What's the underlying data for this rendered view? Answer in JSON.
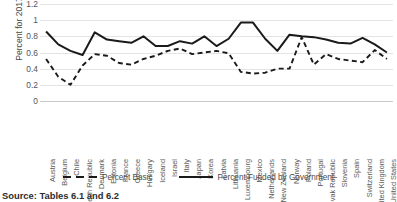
{
  "chart_data": {
    "type": "line",
    "title": "",
    "xlabel": "",
    "ylabel": "Percent for 2017",
    "ylim": [
      0,
      1.2
    ],
    "grid": true,
    "legend_position": "bottom",
    "ytick_labels": [
      "1.2",
      "1",
      "0.8",
      "0.6",
      "0.4",
      "0.2",
      "0"
    ],
    "ytick_values": [
      1.2,
      1,
      0.8,
      0.6,
      0.4,
      0.2,
      0
    ],
    "categories": [
      "Austria",
      "Belgium",
      "Chile",
      "Czech Republic",
      "Denmark",
      "Estonia",
      "France",
      "Greece",
      "Hungary",
      "Iceland",
      "Israel",
      "Italy",
      "Japan",
      "Korea",
      "Latvia",
      "Lithuania",
      "Luxembourg",
      "Mexico",
      "Netherlands",
      "New Zealand",
      "Norway",
      "Poland",
      "Portugal",
      "Slovak Republic",
      "Slovenia",
      "Spain",
      "Switzerland",
      "United Kingdom",
      "United States"
    ],
    "series": [
      {
        "name": "Percent Basic",
        "style": "dashed",
        "color": "#1a1a1a",
        "values": [
          0.52,
          0.3,
          0.2,
          0.44,
          0.58,
          0.56,
          0.47,
          0.45,
          0.52,
          0.56,
          0.62,
          0.65,
          0.58,
          0.6,
          0.62,
          0.59,
          0.36,
          0.34,
          0.35,
          0.4,
          0.4,
          0.79,
          0.45,
          0.58,
          0.52,
          0.5,
          0.48,
          0.63,
          0.52
        ]
      },
      {
        "name": "Percent Funded by Government",
        "style": "solid",
        "color": "#1a1a1a",
        "values": [
          0.86,
          0.7,
          0.62,
          0.57,
          0.85,
          0.76,
          0.74,
          0.72,
          0.8,
          0.68,
          0.68,
          0.74,
          0.71,
          0.8,
          0.68,
          0.77,
          0.97,
          0.97,
          0.77,
          0.62,
          0.82,
          0.8,
          0.79,
          0.76,
          0.72,
          0.71,
          0.78,
          0.7,
          0.6
        ]
      }
    ]
  },
  "legend": {
    "items": [
      {
        "label": "Percent Basic",
        "style": "dashed"
      },
      {
        "label": "Percent Funded by Government",
        "style": "solid"
      }
    ]
  },
  "source_note": "Source: Tables 6.1 and 6.2"
}
